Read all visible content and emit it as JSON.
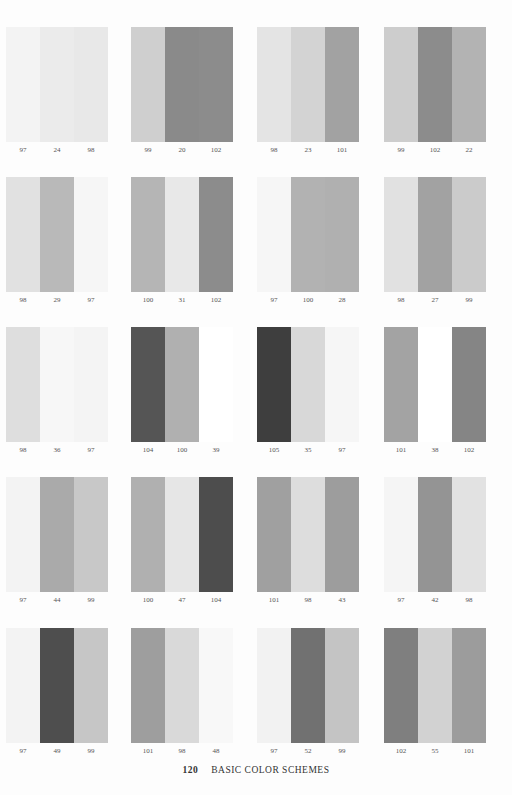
{
  "page": {
    "number": "120",
    "title": "BASIC COLOR SCHEMES"
  },
  "groups": [
    {
      "row": 0,
      "col": 0,
      "labels": [
        "97",
        "24",
        "98"
      ],
      "colors": [
        "#f3f3f3",
        "#ebebeb",
        "#e8e8e8"
      ]
    },
    {
      "row": 0,
      "col": 1,
      "labels": [
        "99",
        "20",
        "102"
      ],
      "colors": [
        "#cfcfcf",
        "#8a8a8a",
        "#8c8c8c"
      ]
    },
    {
      "row": 0,
      "col": 2,
      "labels": [
        "98",
        "23",
        "101"
      ],
      "colors": [
        "#e4e4e4",
        "#d3d3d3",
        "#a2a2a2"
      ]
    },
    {
      "row": 0,
      "col": 3,
      "labels": [
        "99",
        "102",
        "22"
      ],
      "colors": [
        "#cdcdcd",
        "#8c8c8c",
        "#b3b3b3"
      ]
    },
    {
      "row": 1,
      "col": 0,
      "labels": [
        "98",
        "29",
        "97"
      ],
      "colors": [
        "#e1e1e1",
        "#b9b9b9",
        "#f6f6f6"
      ]
    },
    {
      "row": 1,
      "col": 1,
      "labels": [
        "100",
        "31",
        "102"
      ],
      "colors": [
        "#b5b5b5",
        "#e8e8e8",
        "#8c8c8c"
      ]
    },
    {
      "row": 1,
      "col": 2,
      "labels": [
        "97",
        "100",
        "28"
      ],
      "colors": [
        "#f6f6f6",
        "#b2b2b2",
        "#b0b0b0"
      ]
    },
    {
      "row": 1,
      "col": 3,
      "labels": [
        "98",
        "27",
        "99"
      ],
      "colors": [
        "#e1e1e1",
        "#a2a2a2",
        "#cbcbcb"
      ]
    },
    {
      "row": 2,
      "col": 0,
      "labels": [
        "98",
        "36",
        "97"
      ],
      "colors": [
        "#dedede",
        "#f7f7f7",
        "#f4f4f4"
      ]
    },
    {
      "row": 2,
      "col": 1,
      "labels": [
        "104",
        "100",
        "39"
      ],
      "colors": [
        "#555555",
        "#b0b0b0",
        "#ffffff"
      ]
    },
    {
      "row": 2,
      "col": 2,
      "labels": [
        "105",
        "35",
        "97"
      ],
      "colors": [
        "#3e3e3e",
        "#d8d8d8",
        "#f6f6f6"
      ]
    },
    {
      "row": 2,
      "col": 3,
      "labels": [
        "101",
        "38",
        "102"
      ],
      "colors": [
        "#a3a3a3",
        "#ffffff",
        "#858585"
      ]
    },
    {
      "row": 3,
      "col": 0,
      "labels": [
        "97",
        "44",
        "99"
      ],
      "colors": [
        "#f3f3f3",
        "#aaaaaa",
        "#c8c8c8"
      ]
    },
    {
      "row": 3,
      "col": 1,
      "labels": [
        "100",
        "47",
        "104"
      ],
      "colors": [
        "#b0b0b0",
        "#e6e6e6",
        "#4d4d4d"
      ]
    },
    {
      "row": 3,
      "col": 2,
      "labels": [
        "101",
        "98",
        "43"
      ],
      "colors": [
        "#a0a0a0",
        "#dddddd",
        "#9d9d9d"
      ]
    },
    {
      "row": 3,
      "col": 3,
      "labels": [
        "97",
        "42",
        "98"
      ],
      "colors": [
        "#f5f5f5",
        "#949494",
        "#e2e2e2"
      ]
    },
    {
      "row": 4,
      "col": 0,
      "labels": [
        "97",
        "49",
        "99"
      ],
      "colors": [
        "#f3f3f3",
        "#4e4e4e",
        "#c6c6c6"
      ]
    },
    {
      "row": 4,
      "col": 1,
      "labels": [
        "101",
        "98",
        "48"
      ],
      "colors": [
        "#9e9e9e",
        "#d9d9d9",
        "#f8f8f8"
      ]
    },
    {
      "row": 4,
      "col": 2,
      "labels": [
        "97",
        "52",
        "99"
      ],
      "colors": [
        "#f2f2f2",
        "#717171",
        "#c4c4c4"
      ]
    },
    {
      "row": 4,
      "col": 3,
      "labels": [
        "102",
        "55",
        "101"
      ],
      "colors": [
        "#7f7f7f",
        "#d2d2d2",
        "#9c9c9c"
      ]
    }
  ]
}
